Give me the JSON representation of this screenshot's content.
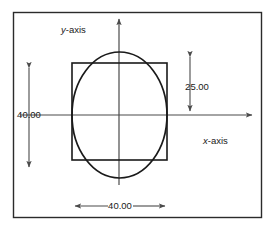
{
  "figure": {
    "title_visible": false,
    "frame": {
      "x": 13,
      "y": 12,
      "width": 249,
      "height": 206,
      "stroke": "#2b2b2b"
    },
    "colors": {
      "line": "#1a1a1a",
      "axis": "#4a4a4a",
      "dimension": "#4a4a4a",
      "text": "#1a1a1a",
      "background": "#ffffff"
    },
    "axes": {
      "x_label": "x-axis",
      "x_label_italic_part": "x",
      "x_label_rest": "-axis",
      "y_label": "y-axis",
      "y_label_italic_part": "y",
      "y_label_rest": "-axis",
      "origin": {
        "x": 119,
        "y": 115
      },
      "x_axis": {
        "x1": 20,
        "y1": 115,
        "x2": 255,
        "y2": 115,
        "arrow": "right"
      },
      "y_axis": {
        "x1": 119,
        "y1": 185,
        "x2": 119,
        "y2": 16,
        "arrow": "up"
      }
    },
    "shapes": [
      {
        "name": "square",
        "type": "rect",
        "x": 72,
        "y": 63,
        "width": 95,
        "height": 97,
        "stroke": "#1a1a1a",
        "fill": "none"
      },
      {
        "name": "circle",
        "type": "ellipse",
        "cx": 119.5,
        "cy": 115,
        "rx": 47.5,
        "ry": 63,
        "stroke": "#1a1a1a",
        "fill": "none"
      }
    ],
    "dimensions": [
      {
        "name": "height-dimension-left",
        "label": "40.00",
        "orientation": "vertical",
        "x": 29,
        "y_start": 63,
        "y_end": 172,
        "label_x": 29,
        "label_y": 118,
        "arrowheads": "both"
      },
      {
        "name": "height-dimension-right",
        "label": "25.00",
        "orientation": "vertical",
        "x": 190,
        "y_start": 52,
        "y_end": 115,
        "label_x": 196,
        "label_y": 87,
        "arrowheads": "both"
      },
      {
        "name": "width-dimension-bottom",
        "label": "40.00",
        "orientation": "horizontal",
        "y": 206,
        "x_start": 70,
        "x_end": 170,
        "label_x": 120,
        "label_y": 209,
        "arrowheads": "both"
      }
    ]
  }
}
